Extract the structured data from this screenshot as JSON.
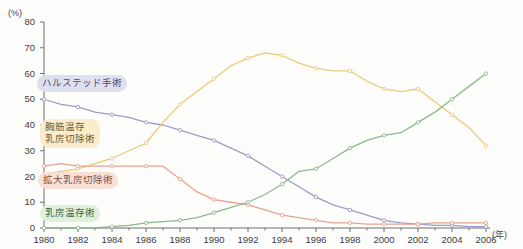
{
  "axes": {
    "y_unit": "(%)",
    "x_unit": "(年)",
    "y_ticks": [
      "0",
      "10",
      "20",
      "30",
      "40",
      "50",
      "60",
      "70",
      "80"
    ],
    "x_ticks": [
      "1980",
      "1982",
      "1984",
      "1986",
      "1988",
      "1990",
      "1992",
      "1994",
      "1996",
      "1998",
      "2000",
      "2002",
      "2004",
      "2006"
    ]
  },
  "labels": {
    "halsted": "ハルステッド手術",
    "pectoral": "胸筋温存\n乳房切除術",
    "extended": "拡大乳房切除術",
    "conserving": "乳房温存術"
  },
  "colors": {
    "halsted": "#9b9cc8",
    "pectoral": "#eec87a",
    "extended": "#e8a391",
    "conserving": "#8cb98a",
    "axis": "#6f6f6f",
    "text": "#3d3d3d"
  },
  "chart_data": {
    "type": "line",
    "title": "",
    "xlabel": "(年)",
    "ylabel": "(%)",
    "xlim": [
      1980,
      2006
    ],
    "ylim": [
      0,
      80
    ],
    "grid": false,
    "legend": "inline-labels",
    "x": [
      1980,
      1981,
      1982,
      1983,
      1984,
      1985,
      1986,
      1987,
      1988,
      1989,
      1990,
      1991,
      1992,
      1993,
      1994,
      1995,
      1996,
      1997,
      1998,
      1999,
      2000,
      2001,
      2002,
      2003,
      2004,
      2005,
      2006
    ],
    "series": [
      {
        "name": "ハルステッド手術",
        "color": "#9b9cc8",
        "values": [
          50,
          48,
          47,
          45,
          44,
          43,
          41,
          40,
          38,
          36,
          34,
          31,
          28,
          24,
          20,
          16,
          12,
          9,
          7,
          5,
          3,
          2,
          1.5,
          1,
          1,
          0.5,
          0.5
        ]
      },
      {
        "name": "胸筋温存乳房切除術",
        "color": "#eec87a",
        "values": [
          21,
          22,
          23,
          25,
          27,
          30,
          33,
          41,
          48,
          53,
          58,
          63,
          66,
          68,
          67,
          64,
          62,
          61,
          61,
          57,
          54,
          53,
          54,
          49,
          44,
          39,
          32
        ]
      },
      {
        "name": "拡大乳房切除術",
        "color": "#e8a391",
        "values": [
          24,
          25,
          24,
          24,
          24,
          24,
          24,
          24,
          19,
          14,
          11,
          10,
          9,
          7,
          5,
          4,
          3,
          2,
          2,
          1.5,
          1.5,
          1.5,
          1.5,
          2,
          2,
          2,
          2
        ]
      },
      {
        "name": "乳房温存術",
        "color": "#8cb98a",
        "values": [
          0,
          0,
          0,
          0,
          0.5,
          1,
          2,
          2.5,
          3,
          4,
          6,
          8,
          10,
          13,
          17,
          22,
          23,
          27,
          31,
          34,
          36,
          37,
          41,
          45,
          50,
          55,
          60
        ]
      }
    ]
  }
}
